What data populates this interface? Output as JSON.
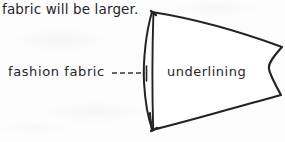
{
  "page": {
    "kind": "hand-drawn sewing instruction diagram",
    "width": 285,
    "height": 142,
    "background_color": "#fdfdfd",
    "ink_color": "#232327"
  },
  "caption": {
    "text": "fabric will be larger."
  },
  "labels": {
    "fashion_fabric": "fashion fabric",
    "underlining": "underlining"
  },
  "leader_line": {
    "style": "dashed",
    "from_x": 112,
    "to_x": 148,
    "y": 73,
    "terminator": "vertical tick"
  },
  "diagram": {
    "name": "garment-piece-with-underlining",
    "outline_path": "M 152 12 C 190 18, 236 30, 282 47 C 272 58, 268 64, 269 69 C 270 75, 275 84, 281 95 C 236 107, 190 121, 152 130 C 150 100, 150 42, 152 12 Z",
    "fashion_fabric_edge_path": "M 152 12 C 146 34, 144 74, 147 104 C 149 116, 151 124, 152 130",
    "underlining_edge_path": "M 153 13 C 152 44, 152 96, 153 129"
  }
}
